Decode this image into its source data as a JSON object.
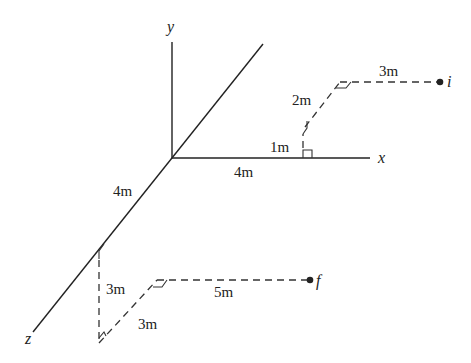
{
  "diagram": {
    "type": "3d-displacement-diagram",
    "axes": {
      "x_label": "x",
      "y_label": "y",
      "z_label": "z"
    },
    "points": {
      "initial_label": "i",
      "final_label": "f"
    },
    "initial_path": {
      "segments": [
        {
          "direction": "+x",
          "length_label": "4m"
        },
        {
          "direction": "+y",
          "length_label": "1m"
        },
        {
          "direction": "-z",
          "length_label": "2m"
        },
        {
          "direction": "+x",
          "length_label": "3m"
        }
      ]
    },
    "final_path": {
      "segments": [
        {
          "direction": "+z",
          "length_label": "4m"
        },
        {
          "direction": "-y",
          "length_label": "3m"
        },
        {
          "direction": "-z",
          "length_label": "3m"
        },
        {
          "direction": "+x",
          "length_label": "5m"
        }
      ]
    },
    "colors": {
      "line": "#222222",
      "background": "#ffffff"
    }
  }
}
